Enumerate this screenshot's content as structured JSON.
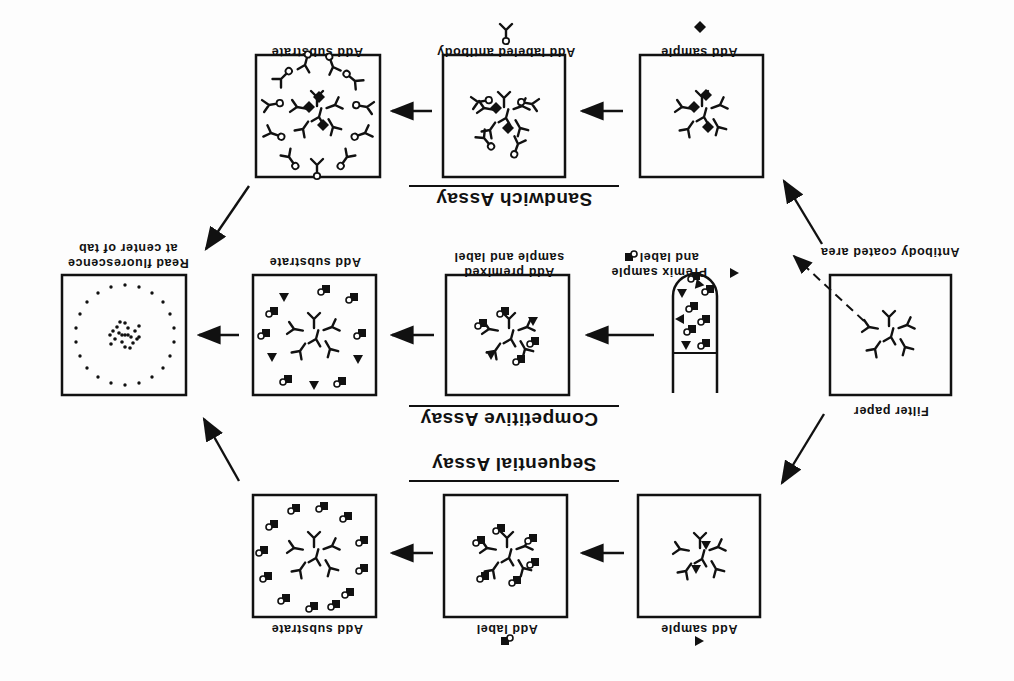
{
  "diagram": {
    "orientation_rotation_deg": 180,
    "colors": {
      "ink": "#111111",
      "paper": "#fdfdfd"
    },
    "start": {
      "filter_paper_label": "Filter paper",
      "antibody_coated_area_label": "Antibody coated area"
    },
    "assays": [
      {
        "title": "Sandwich Assay",
        "steps": [
          {
            "label": "Add sample",
            "reagent_icon": "diamond-antigen-icon"
          },
          {
            "label": "Add labeled antibody",
            "reagent_icon": "labeled-antibody-icon"
          },
          {
            "label": "Add substrate"
          }
        ]
      },
      {
        "title": "Competitive Assay",
        "steps": [
          {
            "label_line1": "Premix sample",
            "label_line2": "and label",
            "reagent_icons": [
              "triangle-antigen-icon",
              "labeled-antigen-icon"
            ]
          },
          {
            "label_line1": "Add premixed",
            "label_line2": "sample and label"
          },
          {
            "label": "Add substrate"
          }
        ]
      },
      {
        "title": "Sequential Assay",
        "steps": [
          {
            "label": "Add sample",
            "reagent_icon": "triangle-antigen-icon"
          },
          {
            "label": "Add label",
            "reagent_icon": "labeled-antigen-icon"
          },
          {
            "label": "Add substrate"
          }
        ]
      }
    ],
    "end": {
      "label_line1": "Read fluorescence",
      "label_line2": "at center of tab"
    }
  }
}
